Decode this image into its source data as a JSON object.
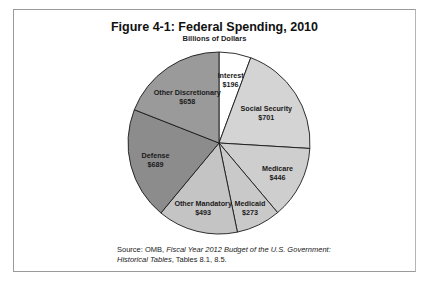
{
  "chart_data": {
    "type": "pie",
    "title": "Figure 4-1: Federal Spending, 2010",
    "subtitle": "Billions of Dollars",
    "unit": "Billions of Dollars",
    "categories": [
      "Interest",
      "Social Security",
      "Medicare",
      "Medicaid",
      "Other Mandatory",
      "Defense",
      "Other Discretionary"
    ],
    "values": [
      196,
      701,
      446,
      273,
      493,
      689,
      658
    ],
    "value_labels": [
      "$196",
      "$701",
      "$446",
      "$273",
      "$493",
      "$689",
      "$658"
    ],
    "colors": [
      "#ffffff",
      "#d4d4d4",
      "#cecece",
      "#c9c9c9",
      "#c4c4c4",
      "#8c8c8c",
      "#9a9a9a"
    ],
    "start_angle_deg": 0,
    "direction": "clockwise",
    "legend": "none (labels inside slices)"
  },
  "source": {
    "prefix": "Source: OMB, ",
    "italic1": "Fiscal Year 2012 Budget of the U.S. Government:",
    "italic2": "Historical Tables",
    "suffix": ", Tables 8.1, 8.5."
  }
}
